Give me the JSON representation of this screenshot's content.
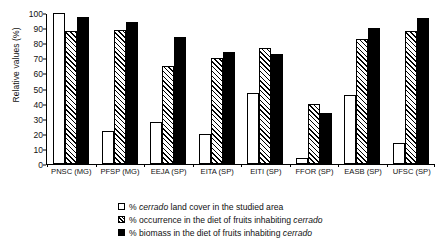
{
  "chart_data": {
    "type": "bar",
    "title": "",
    "xlabel": "",
    "ylabel": "Relative values (%)",
    "ylim": [
      0,
      100
    ],
    "ytick_step": 10,
    "yticks": [
      0,
      10,
      20,
      30,
      40,
      50,
      60,
      70,
      80,
      90,
      100
    ],
    "grid": false,
    "legend_position": "bottom-center",
    "categories": [
      "PNSC (MG)",
      "PFSP (MG)",
      "EEJA (SP)",
      "EITA (SP)",
      "EITI (SP)",
      "FFOR (SP)",
      "EASB (SP)",
      "UFSC (SP)"
    ],
    "series": [
      {
        "name": "% cerrado land cover in the studied area",
        "style": "white",
        "values": [
          100,
          22,
          28,
          20,
          47,
          4,
          46,
          14
        ]
      },
      {
        "name": "% occurrence in the diet of fruits inhabiting cerrado",
        "style": "hatch",
        "values": [
          88,
          88.5,
          65,
          70.5,
          77,
          40,
          83,
          88
        ]
      },
      {
        "name": "% biomass in the diet of fruits inhabiting cerrado",
        "style": "black",
        "values": [
          97.5,
          94,
          84,
          74.5,
          73,
          34,
          90,
          96.5
        ]
      }
    ],
    "legend": [
      {
        "style": "white",
        "prefix": "% ",
        "italic": "cerrado",
        "suffix": " land cover in the studied area"
      },
      {
        "style": "hatch",
        "prefix": "% occurrence in the diet of fruits inhabiting ",
        "italic": "cerrado",
        "suffix": ""
      },
      {
        "style": "black",
        "prefix": "% biomass in the diet of fruits inhabiting ",
        "italic": "cerrado",
        "suffix": ""
      }
    ]
  }
}
